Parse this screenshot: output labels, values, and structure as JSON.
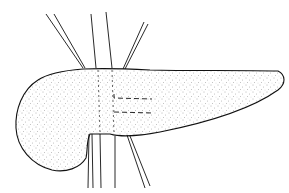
{
  "illustration": {
    "subject": "pancreas line drawing with vessels",
    "colors": {
      "background": "#ffffff",
      "ink": "#111111",
      "stipple": "#555555"
    }
  }
}
